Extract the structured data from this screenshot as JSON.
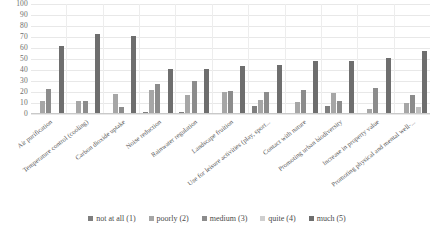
{
  "chart_data": {
    "type": "bar",
    "title": "",
    "subtitle": "",
    "xlabel": "",
    "ylabel": "",
    "ylim": [
      0,
      100
    ],
    "ytick_labels": [
      "100",
      "90",
      "80",
      "70",
      "60",
      "50",
      "40",
      "30",
      "20",
      "10",
      "0"
    ],
    "ytick_values": [
      100,
      90,
      80,
      70,
      60,
      50,
      40,
      30,
      20,
      10,
      0
    ],
    "grid": true,
    "legend_position": "bottom",
    "categories": [
      "Air purification",
      "Temperature control (cooling)",
      "Carbon dioxide uptake",
      "Noise reduction",
      "Rainwater regulation",
      "Landscape fruition",
      "Use for leisure activities (play, sport...",
      "Contact with nature",
      "Promoting urban biodiversity",
      "Increase in property value",
      "Promoting physical and mental well-..."
    ],
    "series": [
      {
        "name": "not at all (1)",
        "color": "#7f7f7f",
        "values": [
          0,
          0,
          0,
          2,
          2,
          0,
          7,
          0,
          7,
          0,
          0
        ]
      },
      {
        "name": "poorly (2)",
        "color": "#a6a6a6",
        "values": [
          12,
          12,
          18,
          22,
          17,
          20,
          13,
          11,
          19,
          5,
          10
        ]
      },
      {
        "name": "medium (3)",
        "color": "#8c8c8c",
        "values": [
          23,
          12,
          6,
          27,
          30,
          21,
          20,
          22,
          12,
          24,
          17
        ]
      },
      {
        "name": "quite (4)",
        "color": "#bfbfbf",
        "values": [
          0,
          0,
          0,
          0,
          0,
          0,
          0,
          0,
          0,
          0,
          6
        ]
      },
      {
        "name": "much (5)",
        "color": "#6e6e6e",
        "values": [
          62,
          73,
          71,
          41,
          41,
          44,
          45,
          48,
          48,
          51,
          57
        ]
      }
    ]
  },
  "legend": {
    "items": [
      {
        "label": "not at all (1)",
        "color": "#7f7f7f"
      },
      {
        "label": "poorly (2)",
        "color": "#a6a6a6"
      },
      {
        "label": "medium (3)",
        "color": "#8c8c8c"
      },
      {
        "label": "quite (4)",
        "color": "#cfcfcf"
      },
      {
        "label": "much (5)",
        "color": "#6e6e6e"
      }
    ]
  }
}
